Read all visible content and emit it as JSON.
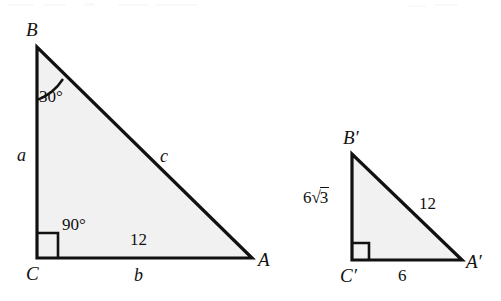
{
  "figure": {
    "background_color": "#ffffff",
    "stroke_color": "#111111",
    "fill_color": "#f1f1f1"
  },
  "triangle_large": {
    "name": "triangle-ABC",
    "vertices": {
      "B": "B",
      "C": "C",
      "A": "A"
    },
    "angles": {
      "at_B": "30°",
      "at_C": "90°"
    },
    "sides": {
      "leg_left_var": "a",
      "hypotenuse_var": "c",
      "base_var": "b",
      "interior_measure": "12"
    }
  },
  "triangle_small": {
    "name": "triangle-A-prime-B-prime-C-prime",
    "vertices": {
      "B_prime": "B′",
      "C_prime": "C′",
      "A_prime": "A′"
    },
    "sides": {
      "leg_left": {
        "coefficient": "6",
        "radical_sign": "√",
        "radicand": "3"
      },
      "hypotenuse": "12",
      "base": "6"
    }
  }
}
